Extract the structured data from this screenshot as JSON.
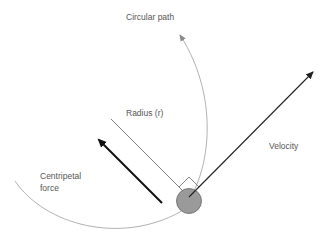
{
  "labels": {
    "circular_path": "Circular path",
    "radius": "Radius (r)",
    "velocity": "Velocity",
    "centripetal_line1": "Centripetal",
    "centripetal_line2": "force"
  },
  "colors": {
    "path": "#a0a0a0",
    "radius_line": "#707070",
    "velocity": "#222222",
    "force": "#111111",
    "ball_fill": "#9a9a9a",
    "ball_stroke": "#666666",
    "text": "#555555"
  }
}
